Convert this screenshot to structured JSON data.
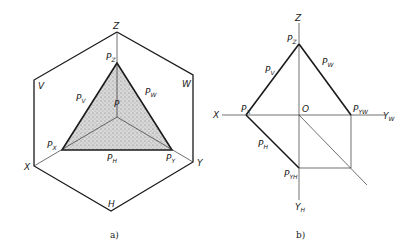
{
  "figure_a": {
    "caption": "a)",
    "labels": {
      "Z": "Z",
      "X": "X",
      "Y": "Y",
      "H": "H",
      "V": "V",
      "W": "W",
      "P": "P",
      "PZ": {
        "main": "P",
        "sub": "Z"
      },
      "PX": {
        "main": "P",
        "sub": "X"
      },
      "PY": {
        "main": "P",
        "sub": "Y"
      },
      "PV": {
        "main": "P",
        "sub": "V"
      },
      "PW": {
        "main": "P",
        "sub": "W"
      },
      "PH": {
        "main": "P",
        "sub": "H"
      }
    },
    "colors": {
      "line": "#1a1a1a",
      "fill": "#cfcfcf"
    }
  },
  "figure_b": {
    "caption": "b)",
    "labels": {
      "Z": "Z",
      "X": "X",
      "O": "O",
      "YW": {
        "main": "Y",
        "sub": "W"
      },
      "YH": {
        "main": "Y",
        "sub": "H"
      },
      "PZ": {
        "main": "P",
        "sub": "Z"
      },
      "PX": {
        "main": "P",
        "sub": "X"
      },
      "PV": {
        "main": "P",
        "sub": "V"
      },
      "PW": {
        "main": "P",
        "sub": "W"
      },
      "PH": {
        "main": "P",
        "sub": "H"
      },
      "PYW": {
        "main": "P",
        "sub": "YW"
      },
      "PYH": {
        "main": "P",
        "sub": "YH"
      }
    }
  }
}
